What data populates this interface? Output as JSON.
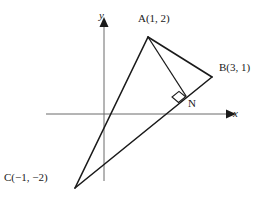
{
  "figure": {
    "type": "geometry-diagram",
    "background_color": "#ffffff",
    "stroke_color": "#1a1a1a",
    "axis_color": "#6b6b6b"
  },
  "axes": {
    "x_label": "x",
    "y_label": "y",
    "origin_px": {
      "x": 104,
      "y": 114
    },
    "x_axis_px": {
      "x1": 46,
      "y1": 114,
      "x2": 228,
      "y2": 114
    },
    "y_axis_px": {
      "x1": 104,
      "y1": 20,
      "x2": 104,
      "y2": 181
    },
    "arrowheads": [
      "x-positive",
      "y-positive"
    ]
  },
  "points": [
    {
      "id": "A",
      "label": "A(1, 2)",
      "coords": {
        "x": 1,
        "y": 2
      },
      "px": {
        "x": 148,
        "y": 37
      }
    },
    {
      "id": "B",
      "label": "B(3, 1)",
      "coords": {
        "x": 3,
        "y": 1
      },
      "px": {
        "x": 212,
        "y": 77
      }
    },
    {
      "id": "C",
      "label": "C(−1, −2)",
      "coords": {
        "x": -1,
        "y": -2
      },
      "px": {
        "x": 75,
        "y": 188
      }
    },
    {
      "id": "N",
      "label": "N",
      "coords": null,
      "px": {
        "x": 186,
        "y": 96
      }
    }
  ],
  "segments": [
    {
      "id": "AB",
      "from": "A",
      "to": "B"
    },
    {
      "id": "AC",
      "from": "A",
      "to": "C"
    },
    {
      "id": "CB_extended",
      "from": "C",
      "to": "B"
    },
    {
      "id": "AN",
      "from": "A",
      "to": "N",
      "note": "altitude"
    }
  ],
  "markers": [
    {
      "id": "right-angle-N",
      "type": "right-angle-square",
      "at": "N",
      "size_px": 9
    }
  ]
}
